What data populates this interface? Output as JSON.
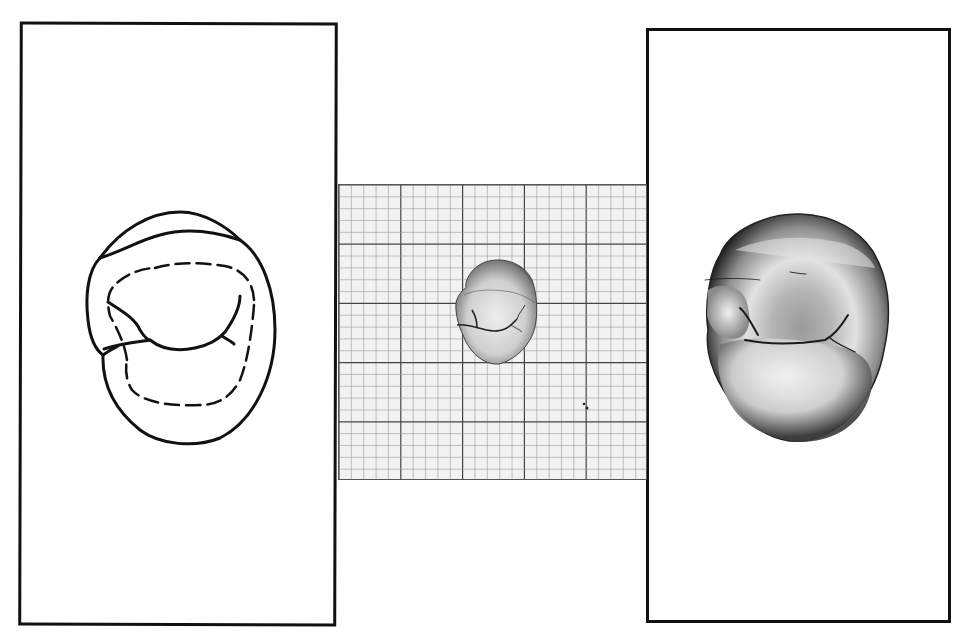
{
  "figure": {
    "panels": [
      {
        "id": "left",
        "kind": "line-drawing",
        "subject": "tooth occlusal outline drawing",
        "icon": "tooth-outline-icon"
      },
      {
        "id": "center",
        "kind": "photo-on-graph-paper",
        "subject": "tooth photograph on millimeter grid",
        "grid": {
          "major_divisions_x": 5,
          "major_divisions_y": 5,
          "minor_per_major": 5
        }
      },
      {
        "id": "right",
        "kind": "photograph",
        "subject": "enlarged tooth occlusal photograph"
      }
    ],
    "colors": {
      "frame": "#111111",
      "grid_minor": "#9a9a9a",
      "grid_major": "#444444",
      "grid_bg": "#f2f2f2",
      "background": "#ffffff"
    }
  }
}
